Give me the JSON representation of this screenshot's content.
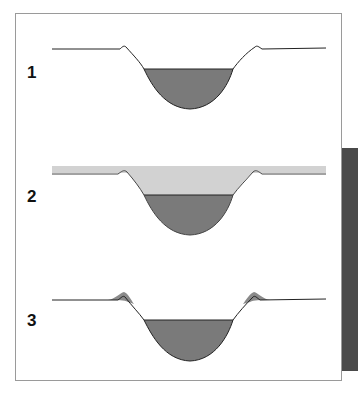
{
  "panels": [
    {
      "label": "1",
      "description": "Channel cross-section with water at low level"
    },
    {
      "label": "2",
      "description": "Channel cross-section with flood water covering banks"
    },
    {
      "label": "3",
      "description": "Channel cross-section with levees built up from sediment deposits"
    }
  ],
  "colors": {
    "water": "#7a7a7a",
    "flood": "#d2d2d2",
    "sediment": "#8a8a8a",
    "line": "#222222",
    "frame": "#9a9a9a",
    "shadow": "#4a4a4a"
  }
}
